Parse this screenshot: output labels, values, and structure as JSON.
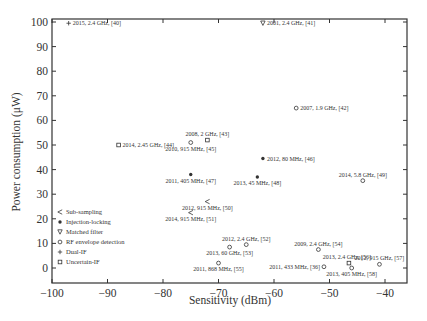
{
  "chart_data": {
    "type": "scatter",
    "title": "",
    "xlabel": "Sensitivity (dBm)",
    "ylabel": "Power consumption (μW)",
    "xlim": [
      -100,
      -36
    ],
    "ylim": [
      -6,
      102
    ],
    "xticks": [
      -100,
      -90,
      -80,
      -70,
      -60,
      -50,
      -40
    ],
    "yticks": [
      0,
      10,
      20,
      30,
      40,
      50,
      60,
      70,
      80,
      90,
      100
    ],
    "grid": false,
    "legend_position": "lower-left",
    "legend": [
      {
        "name": "Sub-sampling",
        "marker": "triangle-left"
      },
      {
        "name": "Injection-locking",
        "marker": "filled-dot"
      },
      {
        "name": "Matched filter",
        "marker": "triangle-down"
      },
      {
        "name": "RF envelope detection",
        "marker": "circle"
      },
      {
        "name": "Dual-IF",
        "marker": "plus"
      },
      {
        "name": "Uncertain-IF",
        "marker": "square"
      }
    ],
    "points": [
      {
        "label": "2015, 2.4 GHz, [40]",
        "x": -97,
        "y": 99.5,
        "category": "Dual-IF",
        "label_pos": "right"
      },
      {
        "label": "2001, 2.4 GHz, [41]",
        "x": -62,
        "y": 99.5,
        "category": "Matched filter",
        "label_pos": "right"
      },
      {
        "label": "2007, 1.9 GHz, [42]",
        "x": -56,
        "y": 65,
        "category": "RF envelope detection",
        "label_pos": "right"
      },
      {
        "label": "2008, 2 GHz, [43]",
        "x": -72,
        "y": 52,
        "category": "Uncertain-IF",
        "label_pos": "above"
      },
      {
        "label": "2014, 2.45 GHz, [44]",
        "x": -88,
        "y": 50,
        "category": "Uncertain-IF",
        "label_pos": "right"
      },
      {
        "label": "2010, 915 MHz, [45]",
        "x": -75,
        "y": 51,
        "category": "RF envelope detection",
        "label_pos": "below"
      },
      {
        "label": "2012, 80 MHz, [46]",
        "x": -62,
        "y": 44.5,
        "category": "Injection-locking",
        "label_pos": "right"
      },
      {
        "label": "2011, 405 MHz, [47]",
        "x": -75,
        "y": 38,
        "category": "Injection-locking",
        "label_pos": "below"
      },
      {
        "label": "2013, 45 MHz, [48]",
        "x": -63,
        "y": 37,
        "category": "Injection-locking",
        "label_pos": "below"
      },
      {
        "label": "2014, 5.8 GHz, [49]",
        "x": -44,
        "y": 35.5,
        "category": "RF envelope detection",
        "label_pos": "above"
      },
      {
        "label": "2012, 915 MHz, [50]",
        "x": -72,
        "y": 27,
        "category": "Sub-sampling",
        "label_pos": "below"
      },
      {
        "label": "2014, 915 MHz, [51]",
        "x": -75,
        "y": 22.5,
        "category": "Sub-sampling",
        "label_pos": "below"
      },
      {
        "label": "2012, 2.4 GHz, [52]",
        "x": -65,
        "y": 9.5,
        "category": "RF envelope detection",
        "label_pos": "above"
      },
      {
        "label": "2013, 60 GHz, [53]",
        "x": -68,
        "y": 8.5,
        "category": "RF envelope detection",
        "label_pos": "below"
      },
      {
        "label": "2009, 2.4 GHz, [54]",
        "x": -52,
        "y": 7.5,
        "category": "RF envelope detection",
        "label_pos": "above"
      },
      {
        "label": "2011, 868 MHz, [55]",
        "x": -70,
        "y": 2,
        "category": "RF envelope detection",
        "label_pos": "below"
      },
      {
        "label": "2011, 433 MHz, [36]",
        "x": -51,
        "y": 0.5,
        "category": "RF envelope detection",
        "label_pos": "left"
      },
      {
        "label": "2013, 2.4 GHz, [56]",
        "x": -46.5,
        "y": 2,
        "category": "Uncertain-IF",
        "label_pos": "above-left"
      },
      {
        "label": "2012, 915 GHz, [57]",
        "x": -41,
        "y": 1.5,
        "category": "RF envelope detection",
        "label_pos": "above"
      },
      {
        "label": "2013, 405 MHz, [58]",
        "x": -46,
        "y": 0,
        "category": "RF envelope detection",
        "label_pos": "below"
      }
    ]
  },
  "axes": {
    "x_title": "Sensitivity (dBm)",
    "y_title": "Power consumption (μW)"
  },
  "colors": {
    "axis": "#333333",
    "marker": "#333333",
    "text": "#333333",
    "background": "#ffffff"
  }
}
